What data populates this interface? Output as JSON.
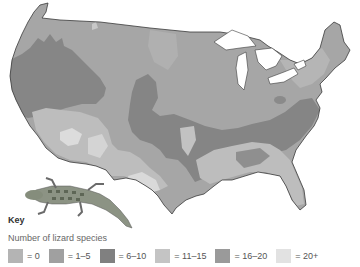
{
  "map": {
    "subject": "United States (contiguous) lizard species richness",
    "border_color": "#333333",
    "land_fill_base": "#a8a8a8"
  },
  "key": {
    "title": "Key",
    "subtitle": "Number of lizard species",
    "items": [
      {
        "label": "= 0",
        "color": "#b4b4b4"
      },
      {
        "label": "= 1–5",
        "color": "#a0a0a0"
      },
      {
        "label": "= 6–10",
        "color": "#808080"
      },
      {
        "label": "= 11–15",
        "color": "#c4c4c4"
      },
      {
        "label": "= 16–20",
        "color": "#9a9a9a"
      },
      {
        "label": "= 20+",
        "color": "#e2e2e2"
      }
    ]
  },
  "illustration": {
    "name": "lizard"
  }
}
